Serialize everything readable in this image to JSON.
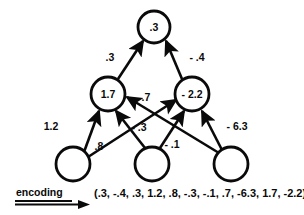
{
  "figure": {
    "type": "neural-network-diagram",
    "background_color": "#ffffff",
    "stroke_color": "#0a0a0a"
  },
  "nodes": {
    "output": [
      {
        "id": "out1",
        "label": ".3",
        "cx": 154,
        "cy": 27,
        "r": 16
      }
    ],
    "hidden": [
      {
        "id": "h1",
        "label": "1.7",
        "cx": 108,
        "cy": 94,
        "r": 17
      },
      {
        "id": "h2",
        "label": "- 2.2",
        "cx": 192,
        "cy": 94,
        "r": 17
      }
    ],
    "input": [
      {
        "id": "i1",
        "label": "",
        "cx": 73,
        "cy": 164,
        "r": 17
      },
      {
        "id": "i2",
        "label": "",
        "cx": 152,
        "cy": 164,
        "r": 17
      },
      {
        "id": "i3",
        "label": "",
        "cx": 231,
        "cy": 164,
        "r": 17
      }
    ]
  },
  "edges": [
    {
      "id": "e_h1_out",
      "from": "h1",
      "to": "out1",
      "weight": ".3",
      "label_x": 110,
      "label_y": 58
    },
    {
      "id": "e_h2_out",
      "from": "h2",
      "to": "out1",
      "weight": "- .4",
      "label_x": 196,
      "label_y": 58
    },
    {
      "id": "e_i1_h1",
      "from": "i1",
      "to": "h1",
      "weight": "1.2",
      "label_x": 51,
      "label_y": 127
    },
    {
      "id": "e_i2_h1",
      "from": "i2",
      "to": "h1",
      "weight": "- .3",
      "label_x": 139,
      "label_y": 128
    },
    {
      "id": "e_i3_h1",
      "from": "i3",
      "to": "h1",
      "weight": ".7",
      "label_x": 146,
      "label_y": 98
    },
    {
      "id": "e_i1_h2",
      "from": "i1",
      "to": "h2",
      "weight": ".8",
      "label_x": 99,
      "label_y": 147
    },
    {
      "id": "e_i2_h2",
      "from": "i2",
      "to": "h2",
      "weight": "- .1",
      "label_x": 172,
      "label_y": 145
    },
    {
      "id": "e_i3_h2",
      "from": "i3",
      "to": "h2",
      "weight": "- 6.3",
      "label_x": 235,
      "label_y": 127
    }
  ],
  "encoding": {
    "label": "encoding",
    "vector_text": "(.3, -.4, .3, 1.2, .8, -.3, -.1, .7, -6.3, 1.7, -2.2)",
    "values": [
      ".3",
      "-.4",
      ".3",
      "1.2",
      ".8",
      "-.3",
      "-.1",
      ".7",
      "-6.3",
      "1.7",
      "-2.2"
    ]
  }
}
